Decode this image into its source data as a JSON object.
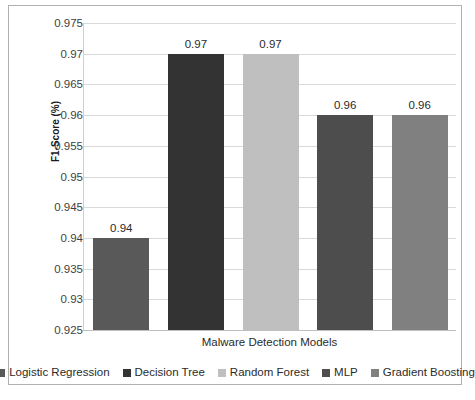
{
  "chart_data": {
    "type": "bar",
    "title": "",
    "xlabel": "Malware Detection Models",
    "ylabel": "F1-Score (%)",
    "categories": [
      "Logistic Regression",
      "Decision Tree",
      "Random Forest",
      "MLP",
      "Gradient Boosting"
    ],
    "values": [
      0.94,
      0.97,
      0.97,
      0.96,
      0.96
    ],
    "data_labels": [
      "0.94",
      "0.97",
      "0.97",
      "0.96",
      "0.96"
    ],
    "bar_colors": [
      "#595959",
      "#333333",
      "#bfbfbf",
      "#4d4d4d",
      "#808080"
    ],
    "ylim": [
      0.925,
      0.975
    ],
    "ytick_values": [
      0.975,
      0.97,
      0.965,
      0.96,
      0.955,
      0.95,
      0.945,
      0.94,
      0.935,
      0.93,
      0.925
    ],
    "ytick_labels": [
      "0.975",
      "0.97",
      "0.965",
      "0.96",
      "0.955",
      "0.95",
      "0.945",
      "0.94",
      "0.935",
      "0.93",
      "0.925"
    ],
    "grid": true,
    "legend_position": "bottom"
  },
  "legend": {
    "items": [
      {
        "label": "Logistic Regression",
        "color": "#595959"
      },
      {
        "label": "Decision Tree",
        "color": "#333333"
      },
      {
        "label": "Random Forest",
        "color": "#bfbfbf"
      },
      {
        "label": "MLP",
        "color": "#4d4d4d"
      },
      {
        "label": "Gradient Boosting",
        "color": "#808080"
      }
    ]
  }
}
